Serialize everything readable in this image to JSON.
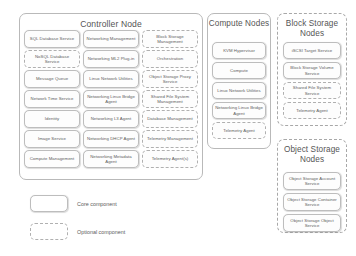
{
  "diagram": {
    "colors": {
      "core_border": "#bdbdbd",
      "optional_border": "#b0b0b0",
      "panel_border": "#b9b9b9",
      "text": "#5c5c5c",
      "background": "#ffffff"
    }
  },
  "panels": {
    "controller": {
      "title": "Controller Node",
      "border_style": "solid",
      "columns": [
        {
          "items": [
            {
              "label": "SQL Database Service",
              "type": "core"
            },
            {
              "label": "NoSQL Database Service",
              "type": "optional"
            },
            {
              "label": "Message Queue",
              "type": "core"
            },
            {
              "label": "Network Time Service",
              "type": "core"
            },
            {
              "label": "Identity",
              "type": "core"
            },
            {
              "label": "Image Service",
              "type": "core"
            },
            {
              "label": "Compute Management",
              "type": "core"
            }
          ]
        },
        {
          "items": [
            {
              "label": "Networking Management",
              "type": "core"
            },
            {
              "label": "Networking ML2 Plug-in",
              "type": "core"
            },
            {
              "label": "Linux Network Utilities",
              "type": "core"
            },
            {
              "label": "Networking Linux Bridge Agent",
              "type": "core"
            },
            {
              "label": "Networking L3 Agent",
              "type": "core"
            },
            {
              "label": "Networking DHCP Agent",
              "type": "core"
            },
            {
              "label": "Networking Metadata Agent",
              "type": "core"
            }
          ]
        },
        {
          "items": [
            {
              "label": "Block Storage Management",
              "type": "optional"
            },
            {
              "label": "Orchestration",
              "type": "optional"
            },
            {
              "label": "Object Storage Proxy Service",
              "type": "optional"
            },
            {
              "label": "Shared File System Management",
              "type": "optional"
            },
            {
              "label": "Database Management",
              "type": "optional"
            },
            {
              "label": "Telemetry Management",
              "type": "optional"
            },
            {
              "label": "Telemetry Agent(s)",
              "type": "optional"
            }
          ]
        }
      ]
    },
    "compute": {
      "title": "Compute Nodes",
      "border_style": "solid",
      "items": [
        {
          "label": "KVM Hypervisor",
          "type": "core"
        },
        {
          "label": "Compute",
          "type": "core"
        },
        {
          "label": "Linux Network Utilities",
          "type": "core"
        },
        {
          "label": "Networking Linux Bridge Agent",
          "type": "core"
        },
        {
          "label": "Telemetry Agent",
          "type": "optional"
        }
      ]
    },
    "block_storage": {
      "title": "Block Storage Nodes",
      "border_style": "dashed",
      "items": [
        {
          "label": "iSCSI Target Service",
          "type": "core"
        },
        {
          "label": "Block Storage Volume Service",
          "type": "core"
        },
        {
          "label": "Shared File System Service",
          "type": "optional"
        },
        {
          "label": "Telemetry Agent",
          "type": "optional"
        }
      ]
    },
    "object_storage": {
      "title": "Object Storage Nodes",
      "border_style": "dashed",
      "items": [
        {
          "label": "Object Storage Account Service",
          "type": "core"
        },
        {
          "label": "Object Storage Container Service",
          "type": "core"
        },
        {
          "label": "Object Storage Object Service",
          "type": "core"
        }
      ]
    }
  },
  "legend": {
    "entries": [
      {
        "label": "Core component",
        "type": "core"
      },
      {
        "label": "Optional component",
        "type": "optional"
      }
    ]
  }
}
